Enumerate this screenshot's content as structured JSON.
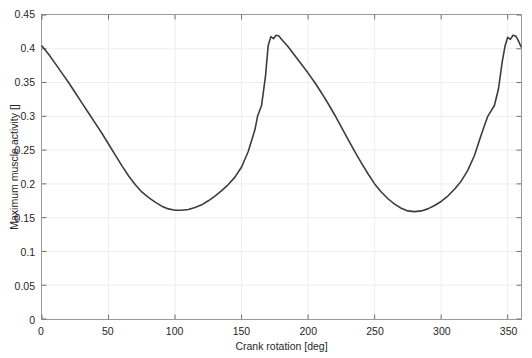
{
  "chart_data": {
    "type": "line",
    "title": "",
    "xlabel": "Crank rotation [deg]",
    "ylabel": "Maximum muscle activity []",
    "xlim": [
      0,
      360
    ],
    "ylim": [
      0,
      0.45
    ],
    "xticks": [
      0,
      50,
      100,
      150,
      200,
      250,
      300,
      350
    ],
    "yticks": [
      0,
      0.05,
      0.1,
      0.15,
      0.2,
      0.25,
      0.3,
      0.35,
      0.4,
      0.45
    ],
    "xtick_labels": [
      "0",
      "50",
      "100",
      "150",
      "200",
      "250",
      "300",
      "350"
    ],
    "ytick_labels": [
      "0",
      "0.05",
      "0.1",
      "0.15",
      "0.2",
      "0.25",
      "0.3",
      "0.35",
      "0.4",
      "0.45"
    ],
    "grid": true,
    "legend": false,
    "line_color": "#3d3d3d",
    "line_width": 1.6,
    "series": [
      {
        "name": "Maximum muscle activity",
        "x": [
          0,
          5,
          10,
          15,
          20,
          25,
          30,
          35,
          40,
          45,
          50,
          55,
          60,
          65,
          70,
          75,
          80,
          85,
          90,
          95,
          100,
          105,
          110,
          115,
          120,
          125,
          130,
          135,
          140,
          145,
          150,
          155,
          160,
          162,
          165,
          168,
          170,
          172,
          174,
          176,
          178,
          180,
          185,
          190,
          195,
          200,
          205,
          210,
          215,
          220,
          225,
          230,
          235,
          240,
          245,
          250,
          255,
          260,
          265,
          270,
          275,
          280,
          285,
          290,
          295,
          300,
          305,
          310,
          315,
          320,
          325,
          330,
          335,
          340,
          343,
          346,
          348,
          350,
          352,
          354,
          356,
          358,
          360
        ],
        "y": [
          0.404,
          0.392,
          0.378,
          0.364,
          0.35,
          0.335,
          0.32,
          0.305,
          0.29,
          0.275,
          0.259,
          0.243,
          0.227,
          0.212,
          0.199,
          0.188,
          0.18,
          0.173,
          0.167,
          0.163,
          0.161,
          0.161,
          0.162,
          0.165,
          0.169,
          0.175,
          0.182,
          0.19,
          0.199,
          0.21,
          0.225,
          0.248,
          0.28,
          0.3,
          0.316,
          0.36,
          0.405,
          0.418,
          0.415,
          0.42,
          0.419,
          0.414,
          0.403,
          0.39,
          0.377,
          0.364,
          0.35,
          0.335,
          0.319,
          0.302,
          0.284,
          0.266,
          0.248,
          0.231,
          0.215,
          0.2,
          0.188,
          0.178,
          0.17,
          0.164,
          0.16,
          0.159,
          0.16,
          0.163,
          0.168,
          0.174,
          0.182,
          0.192,
          0.204,
          0.22,
          0.242,
          0.272,
          0.3,
          0.316,
          0.34,
          0.382,
          0.404,
          0.417,
          0.414,
          0.42,
          0.419,
          0.412,
          0.403
        ]
      }
    ]
  }
}
